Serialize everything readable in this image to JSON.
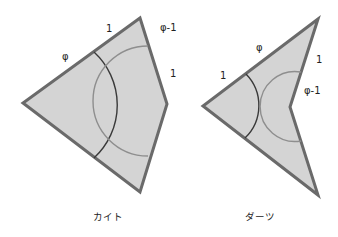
{
  "colors": {
    "fill": "#d4d4d4",
    "outline": "#6a6a6a",
    "arc_dark": "#3a3a3a",
    "arc_light": "#8e8e8e"
  },
  "kite": {
    "caption": "カイト",
    "vertices": {
      "top": [
        140,
        18
      ],
      "left": [
        23,
        103
      ],
      "right": [
        167,
        104
      ],
      "bottom": [
        140,
        192
      ]
    },
    "labels": {
      "upper_left_outer": "φ",
      "upper_left_inner": "1",
      "upper_right_top": "φ-1",
      "upper_right_bottom": "1"
    }
  },
  "dart": {
    "caption": "ダーツ",
    "vertices": {
      "top": [
        318,
        19
      ],
      "left": [
        203,
        106
      ],
      "inner": [
        290,
        107
      ],
      "bottom": [
        318,
        195
      ]
    },
    "labels": {
      "upper_left_outer": "1",
      "upper_left_inner": "φ",
      "upper_right_top": "1",
      "upper_right_bottom": "φ-1"
    }
  }
}
